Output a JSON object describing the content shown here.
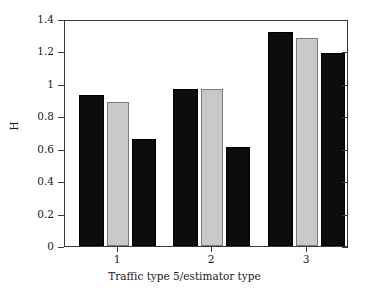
{
  "chart_data": {
    "type": "bar",
    "title": "",
    "xlabel": "Traffic type 5/estimator type",
    "ylabel": "H",
    "categories": [
      "1",
      "2",
      "3"
    ],
    "series": [
      {
        "name": "estimator-a",
        "color": "#0d0d0d",
        "values": [
          0.93,
          0.97,
          1.32
        ]
      },
      {
        "name": "estimator-b",
        "color": "#c9c9c9",
        "values": [
          0.89,
          0.97,
          1.28
        ]
      },
      {
        "name": "estimator-c",
        "color": "#0d0d0d",
        "values": [
          0.66,
          0.61,
          1.19
        ]
      }
    ],
    "ylim": [
      0,
      1.4
    ],
    "ytick_values": [
      0,
      0.2,
      0.4,
      0.6,
      0.8,
      1.0,
      1.2,
      1.4
    ],
    "ytick_labels": [
      "0",
      "0.2",
      "0.4",
      "0.6",
      "0.8",
      "1",
      "1.2",
      "1.4"
    ],
    "grid": false,
    "legend": "none",
    "frame": true
  },
  "axes": {
    "y_label": "H",
    "x_label": "Traffic type 5/estimator type",
    "y_ticks": [
      {
        "label": "1.4",
        "value": 1.4
      },
      {
        "label": "1.2",
        "value": 1.2
      },
      {
        "label": "1",
        "value": 1.0
      },
      {
        "label": "0.8",
        "value": 0.8
      },
      {
        "label": "0.6",
        "value": 0.6
      },
      {
        "label": "0.4",
        "value": 0.4
      },
      {
        "label": "0.2",
        "value": 0.2
      },
      {
        "label": "0",
        "value": 0
      }
    ],
    "x_ticks": [
      {
        "label": "1"
      },
      {
        "label": "2"
      },
      {
        "label": "3"
      }
    ]
  },
  "colors": {
    "dark_bar": "#0d0d0d",
    "light_bar": "#c9c9c9",
    "light_bar_edge": "#7a7a7a",
    "axis": "#3a3a3a",
    "background": "#ffffff",
    "text": "#1a1a1a"
  }
}
